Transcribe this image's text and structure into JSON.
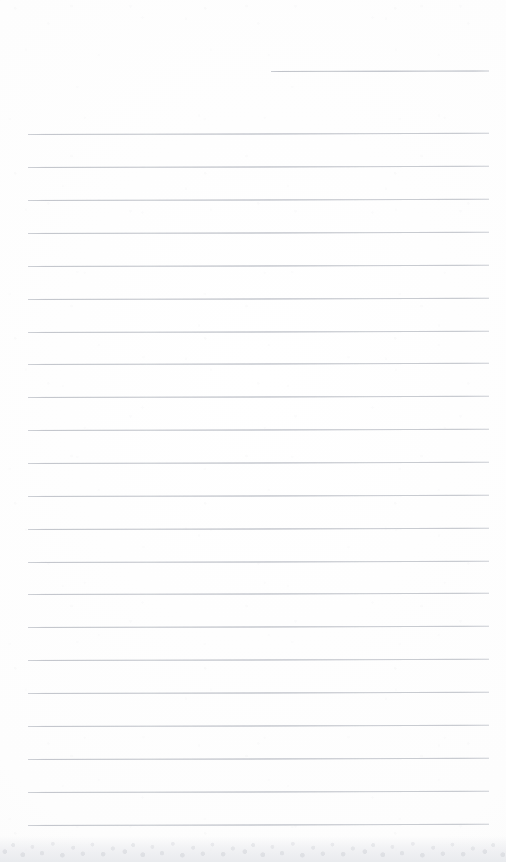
{
  "document": {
    "kind": "scanned-ruled-paper",
    "title": "",
    "visible_text": "",
    "page_width": 506,
    "page_height": 862,
    "background_color": "#fdfdfd",
    "rule_color": "#c9ccd2",
    "bottom_edge_color": "#e6e8ec"
  },
  "layout": {
    "rule_left_x": 28,
    "rule_right_x": 489,
    "rule_thickness_px": 1,
    "rule_spacing_px": 32.9,
    "first_full_rule_y": 134,
    "last_full_rule_y": 825,
    "full_rule_count": 22,
    "header_rule": {
      "present": true,
      "label": "header-date-rule",
      "x_start": 271,
      "x_end": 489,
      "y": 71,
      "width": 218
    }
  },
  "rules": [
    {
      "id": "header-rule",
      "y": 71,
      "x": 271,
      "width": 218,
      "variant": "short"
    },
    {
      "id": "rule-01",
      "y": 134,
      "x": 28,
      "width": 461,
      "variant": "full"
    },
    {
      "id": "rule-02",
      "y": 167,
      "x": 28,
      "width": 461,
      "variant": "full"
    },
    {
      "id": "rule-03",
      "y": 200,
      "x": 28,
      "width": 461,
      "variant": "full"
    },
    {
      "id": "rule-04",
      "y": 233,
      "x": 28,
      "width": 461,
      "variant": "full"
    },
    {
      "id": "rule-05",
      "y": 266,
      "x": 28,
      "width": 461,
      "variant": "full"
    },
    {
      "id": "rule-06",
      "y": 299,
      "x": 28,
      "width": 461,
      "variant": "full"
    },
    {
      "id": "rule-07",
      "y": 332,
      "x": 28,
      "width": 461,
      "variant": "full"
    },
    {
      "id": "rule-08",
      "y": 364,
      "x": 28,
      "width": 461,
      "variant": "full"
    },
    {
      "id": "rule-09",
      "y": 397,
      "x": 28,
      "width": 461,
      "variant": "full"
    },
    {
      "id": "rule-10",
      "y": 430,
      "x": 28,
      "width": 461,
      "variant": "full"
    },
    {
      "id": "rule-11",
      "y": 463,
      "x": 28,
      "width": 461,
      "variant": "full"
    },
    {
      "id": "rule-12",
      "y": 496,
      "x": 28,
      "width": 461,
      "variant": "full"
    },
    {
      "id": "rule-13",
      "y": 529,
      "x": 28,
      "width": 461,
      "variant": "full"
    },
    {
      "id": "rule-14",
      "y": 562,
      "x": 28,
      "width": 461,
      "variant": "full"
    },
    {
      "id": "rule-15",
      "y": 594,
      "x": 28,
      "width": 461,
      "variant": "full"
    },
    {
      "id": "rule-16",
      "y": 627,
      "x": 28,
      "width": 461,
      "variant": "full"
    },
    {
      "id": "rule-17",
      "y": 660,
      "x": 28,
      "width": 461,
      "variant": "full"
    },
    {
      "id": "rule-18",
      "y": 693,
      "x": 28,
      "width": 461,
      "variant": "full"
    },
    {
      "id": "rule-19",
      "y": 726,
      "x": 28,
      "width": 461,
      "variant": "full"
    },
    {
      "id": "rule-20",
      "y": 759,
      "x": 28,
      "width": 461,
      "variant": "full"
    },
    {
      "id": "rule-21",
      "y": 792,
      "x": 28,
      "width": 461,
      "variant": "full"
    },
    {
      "id": "rule-22",
      "y": 825,
      "x": 28,
      "width": 461,
      "variant": "full"
    }
  ],
  "writing_lines": []
}
